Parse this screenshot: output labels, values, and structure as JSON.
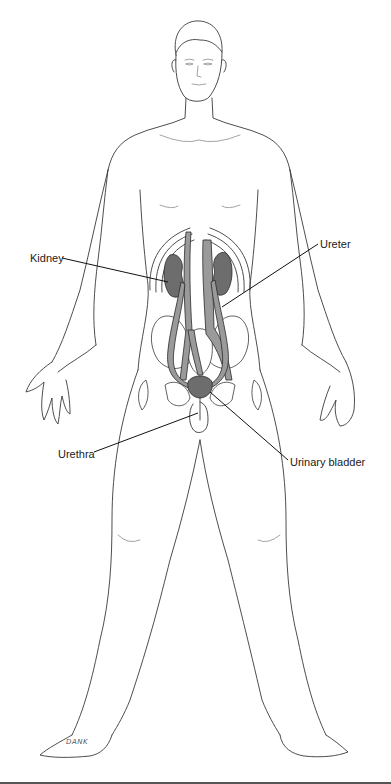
{
  "figure": {
    "labels": {
      "kidney": "Kidney",
      "ureter": "Ureter",
      "urethra": "Urethra",
      "urinary_bladder": "Urinary bladder"
    },
    "signature": "DANK"
  },
  "colors": {
    "background": "#ffffff",
    "line": "#3a3a3a",
    "organ_fill": "#6d6d6d",
    "vessel_fill": "#9a9a9a",
    "bottom_bar": "#555555"
  }
}
